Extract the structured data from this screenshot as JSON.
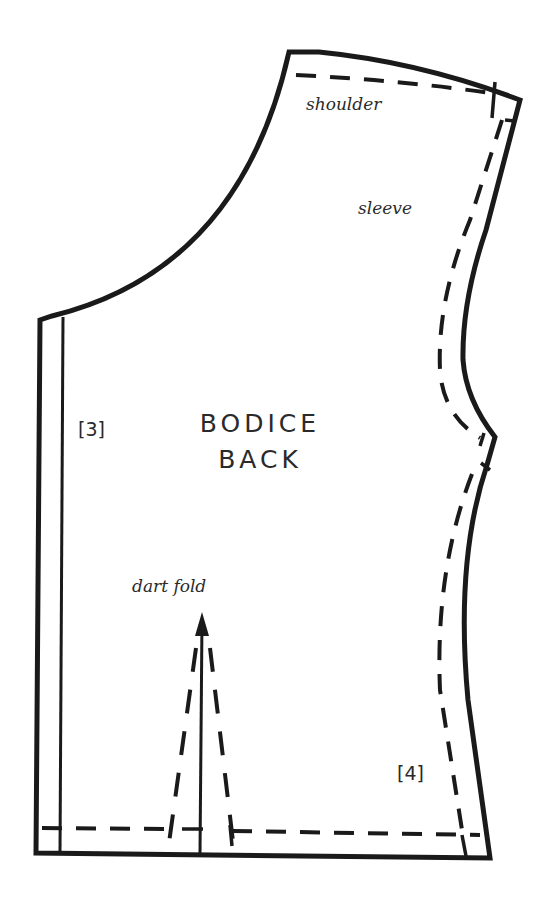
{
  "pattern": {
    "title_line1": "BODICE",
    "title_line2": "BACK",
    "labels": {
      "shoulder": "shoulder",
      "sleeve": "sleeve",
      "dart_fold": "dart fold",
      "marker_3": "[3]",
      "marker_4": "[4]"
    },
    "colors": {
      "line": "#1a1a1a",
      "background": "#ffffff"
    }
  }
}
